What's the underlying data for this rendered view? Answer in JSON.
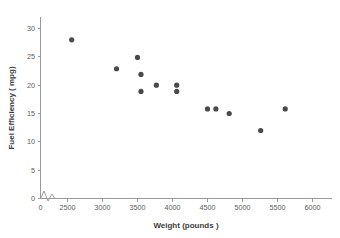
{
  "chart_data": {
    "type": "scatter",
    "title": "",
    "xlabel": "Weight (pounds )",
    "ylabel": "Fuel Efficiency ( mpg)",
    "xlim": [
      0,
      6250
    ],
    "ylim": [
      0,
      31.5
    ],
    "grid": false,
    "legend": null,
    "axis_break_x": true,
    "axis_break_y": true,
    "x_ticks": [
      0,
      2500,
      3000,
      3500,
      4000,
      4500,
      5000,
      5500,
      6000
    ],
    "x_tick_labels": [
      "0",
      "2500",
      "3000",
      "3500",
      "4000",
      "4500",
      "5000",
      "5500",
      "6000"
    ],
    "y_ticks": [
      0,
      5,
      10,
      15,
      20,
      25,
      30
    ],
    "y_tick_labels": [
      "0",
      "5",
      "10",
      "15",
      "20",
      "25",
      "30"
    ],
    "marker": {
      "shape": "circle",
      "color": "#4a4a4a",
      "radius_px": 2.6
    },
    "points": [
      {
        "x": 2560,
        "y": 28.0
      },
      {
        "x": 3200,
        "y": 22.9
      },
      {
        "x": 3500,
        "y": 24.9
      },
      {
        "x": 3550,
        "y": 21.9
      },
      {
        "x": 3550,
        "y": 18.9
      },
      {
        "x": 3770,
        "y": 20.0
      },
      {
        "x": 4060,
        "y": 20.0
      },
      {
        "x": 4060,
        "y": 18.9
      },
      {
        "x": 4500,
        "y": 15.8
      },
      {
        "x": 4620,
        "y": 15.8
      },
      {
        "x": 4810,
        "y": 15.0
      },
      {
        "x": 5260,
        "y": 12.0
      },
      {
        "x": 5610,
        "y": 15.8
      }
    ],
    "colors": {
      "marker": "#4a4a4a",
      "axis": "#9a9a9a",
      "tick_label": "#5a5a5a",
      "axis_title": "#3d3d3d",
      "background": "#ffffff"
    }
  }
}
